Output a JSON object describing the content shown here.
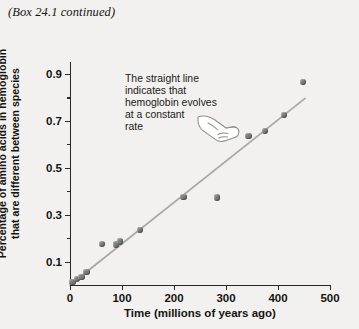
{
  "header": {
    "box_note": "(Box 24.1 continued)"
  },
  "annotation": {
    "text": "The straight line\nindicates that\nhemoglobin evolves\nat a constant\nrate",
    "pointer_icon": "pointing-hand-icon"
  },
  "colors": {
    "background": "#f2f1ef",
    "axis": "#2a2823",
    "point": "#7b7d7a",
    "trend_line": "#a9aaa6",
    "text": "#16140f"
  },
  "chart_data": {
    "type": "scatter",
    "title": "",
    "xlabel": "Time (millions of years ago)",
    "ylabel": "Percentage of amino acids in hemoglobin that are different between species",
    "xlim": [
      0,
      500
    ],
    "ylim": [
      0,
      0.95
    ],
    "xticks": [
      0,
      100,
      200,
      300,
      400,
      500
    ],
    "xtick_labels": [
      "0",
      "100",
      "200",
      "300",
      "400",
      "500"
    ],
    "yticks": [
      0.1,
      0.3,
      0.5,
      0.7,
      0.9
    ],
    "ytick_labels": [
      "0.1",
      "0.3",
      "0.5",
      "0.7",
      "0.9"
    ],
    "yticks_minor": [
      0.2,
      0.4,
      0.6,
      0.8
    ],
    "grid": false,
    "legend": false,
    "points": [
      {
        "x": 5,
        "y": 0.012
      },
      {
        "x": 14,
        "y": 0.025
      },
      {
        "x": 22,
        "y": 0.035
      },
      {
        "x": 32,
        "y": 0.055
      },
      {
        "x": 62,
        "y": 0.175
      },
      {
        "x": 88,
        "y": 0.172
      },
      {
        "x": 96,
        "y": 0.185
      },
      {
        "x": 135,
        "y": 0.235
      },
      {
        "x": 218,
        "y": 0.375
      },
      {
        "x": 283,
        "y": 0.373
      },
      {
        "x": 343,
        "y": 0.635
      },
      {
        "x": 375,
        "y": 0.655
      },
      {
        "x": 412,
        "y": 0.725
      },
      {
        "x": 448,
        "y": 0.865
      }
    ],
    "trend_line": {
      "type": "line",
      "x": [
        0,
        452
      ],
      "y": [
        0.0,
        0.795
      ]
    }
  }
}
